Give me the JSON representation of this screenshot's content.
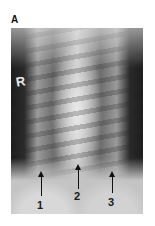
{
  "figure": {
    "panel_label": "A",
    "side_marker": "R",
    "annotations": [
      {
        "number": "1",
        "arrow_x": 41
      },
      {
        "number": "2",
        "arrow_x": 78
      },
      {
        "number": "3",
        "arrow_x": 112
      }
    ],
    "colors": {
      "background": "#ffffff",
      "arrow": "#111111",
      "marker": "#e8e8e8"
    }
  }
}
